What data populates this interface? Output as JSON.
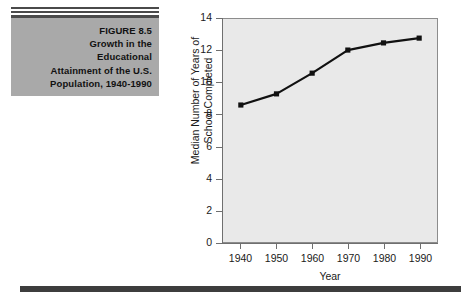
{
  "figure": {
    "rules_count": 3,
    "caption_lines": [
      "FIGURE 8.5",
      "Growth in the",
      "Educational",
      "Attainment of the U.S.",
      "Population, 1940-1990"
    ],
    "box_color": "#a9a9a9"
  },
  "chart_data": {
    "type": "line",
    "title": "",
    "xlabel": "Year",
    "ylabel": "Median Number of Years of School Completed",
    "ylabel_lines": [
      "Median Number of Years of",
      "School Completed"
    ],
    "categories": [
      1940,
      1950,
      1960,
      1970,
      1980,
      1990
    ],
    "x_tick_labels": [
      "1940",
      "1950",
      "1960",
      "1970",
      "1980",
      "1990"
    ],
    "values": [
      8.6,
      9.3,
      10.6,
      12.05,
      12.5,
      12.8
    ],
    "y_tick_labels": [
      "0",
      "2",
      "4",
      "6",
      "8",
      "10",
      "12",
      "14"
    ],
    "y_ticks": [
      0,
      2,
      4,
      6,
      8,
      10,
      12,
      14
    ],
    "ylim": [
      0,
      14
    ],
    "xlim": [
      1935,
      1995
    ],
    "grid": false,
    "legend": null,
    "marker": "square",
    "line_color": "#111111",
    "plot_background": "#e9e9e9"
  },
  "decor": {
    "bottom_bar_color": "#3d3d3d"
  }
}
